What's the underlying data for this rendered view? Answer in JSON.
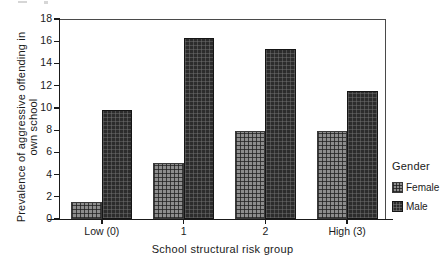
{
  "chart_data": {
    "type": "bar",
    "title": "",
    "xlabel": "School structural risk group",
    "ylabel": "Prevalence of aggressive offending in own school",
    "ylabel_line1": "Prevalence of aggressive offending in",
    "ylabel_line2": "own school",
    "categories": [
      "Low (0)",
      "1",
      "2",
      "High (3)"
    ],
    "series": [
      {
        "name": "Female",
        "values": [
          1.5,
          5.0,
          7.9,
          7.9
        ],
        "color": "#8d8d8d"
      },
      {
        "name": "Male",
        "values": [
          9.8,
          16.3,
          15.3,
          11.5
        ],
        "color": "#2c2c2c"
      }
    ],
    "ylim": [
      0,
      18
    ],
    "yticks": [
      0,
      2,
      4,
      6,
      8,
      10,
      12,
      14,
      16,
      18
    ],
    "ytick_labels": [
      "0",
      "2",
      "4",
      "6",
      "8",
      "10",
      "12",
      "14",
      "16",
      "18"
    ],
    "grid": false,
    "legend": {
      "title": "Gender",
      "position": "right",
      "entries": [
        "Female",
        "Male"
      ]
    }
  },
  "legend": {
    "title": "Gender",
    "items": [
      {
        "label": "Female",
        "swatch": "female-swatch-icon"
      },
      {
        "label": "Male",
        "swatch": "male-swatch-icon"
      }
    ]
  }
}
